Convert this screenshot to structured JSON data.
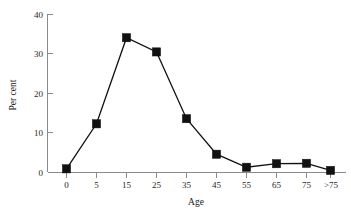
{
  "chart_data": {
    "type": "line",
    "title": "",
    "subtitle": "",
    "xlabel": "Age",
    "ylabel": "Per cent",
    "categories": [
      "0",
      "5",
      "15",
      "25",
      "35",
      "45",
      "55",
      "65",
      "75",
      ">75"
    ],
    "values": [
      0.8,
      12.2,
      34.0,
      30.4,
      13.5,
      4.5,
      1.2,
      2.1,
      2.2,
      0.4
    ],
    "series": [
      {
        "name": "Per cent",
        "values": [
          0.8,
          12.2,
          34.0,
          30.4,
          13.5,
          4.5,
          1.2,
          2.1,
          2.2,
          0.4
        ]
      }
    ],
    "ylim": [
      0,
      40
    ],
    "yticks": [
      "0",
      "10",
      "20",
      "30",
      "40"
    ],
    "ytick_values": [
      0,
      10,
      20,
      30,
      40
    ],
    "xticks": [
      "0",
      "5",
      "15",
      "25",
      "35",
      "45",
      "55",
      "65",
      "75",
      ">75"
    ],
    "grid": false,
    "legend": false,
    "legend_position": "none",
    "marker": "square",
    "line_color": "#111111",
    "marker_color": "#111111",
    "axis_color": "#8a8a8a",
    "background_color": "#ffffff"
  }
}
